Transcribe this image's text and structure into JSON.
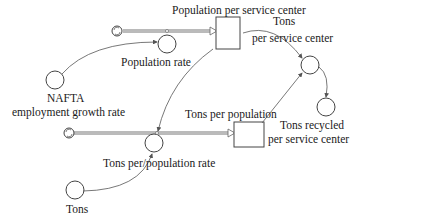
{
  "diagram": {
    "type": "stock-and-flow",
    "stocks": [
      {
        "id": "population_per_service_center",
        "label": "Population per service center"
      },
      {
        "id": "tons_per_population",
        "label": "Tons per population"
      }
    ],
    "flows": [
      {
        "id": "population_rate",
        "label": "Population rate",
        "into": "population_per_service_center"
      },
      {
        "id": "tons_per_population_rate",
        "label": "Tons per/population  rate",
        "into": "tons_per_population"
      }
    ],
    "auxiliaries": [
      {
        "id": "nafta",
        "label_line1": "NAFTA",
        "label_line2": "employment growth rate"
      },
      {
        "id": "tons",
        "label": "Tons"
      },
      {
        "id": "tons_per_service_center",
        "label_line1": "Tons",
        "label_line2": "per service center"
      },
      {
        "id": "tons_recycled",
        "label_line1": "Tons recycled",
        "label_line2": "per service center"
      }
    ],
    "links": [
      {
        "from": "nafta",
        "to": "population_rate"
      },
      {
        "from": "population_per_service_center",
        "to": "tons_per_population_rate"
      },
      {
        "from": "tons",
        "to": "tons_per_population_rate"
      },
      {
        "from": "population_per_service_center",
        "to": "tons_per_service_center"
      },
      {
        "from": "tons_per_population",
        "to": "tons_per_service_center"
      },
      {
        "from": "tons_per_service_center",
        "to": "tons_recycled"
      }
    ],
    "colors": {
      "line": "#555555",
      "pipe": "#888888",
      "text": "#1a1a1a"
    }
  }
}
